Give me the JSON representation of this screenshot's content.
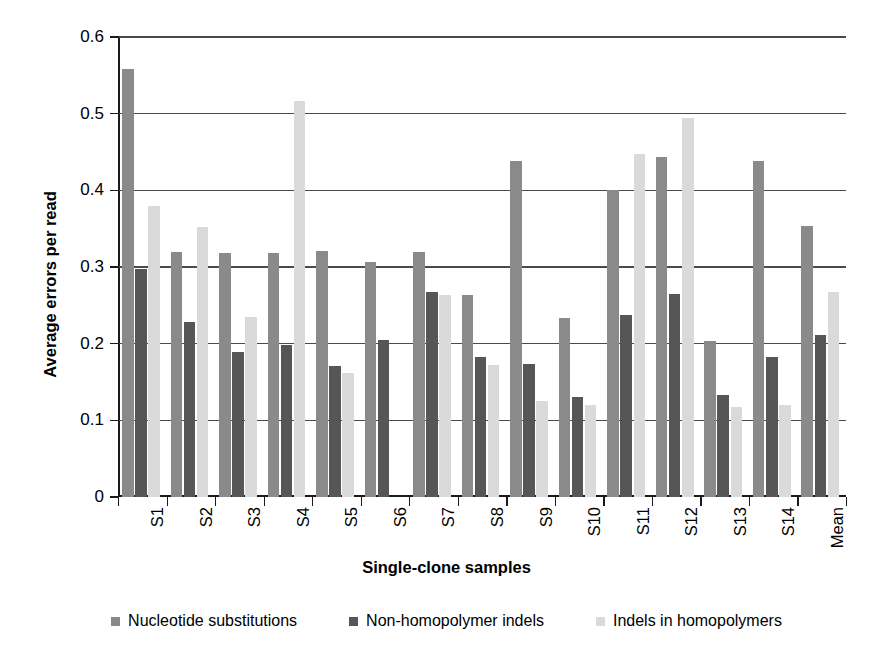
{
  "chart_data": {
    "type": "bar",
    "title": "",
    "xlabel": "Single-clone samples",
    "ylabel": "Average errors per read",
    "ylim": [
      0,
      0.6
    ],
    "yticks": [
      0,
      0.1,
      0.2,
      0.3,
      0.4,
      0.5,
      0.6
    ],
    "ytick_labels": [
      "0",
      "0.1",
      "0.2",
      "0.3",
      "0.4",
      "0.5",
      "0.6"
    ],
    "grid": true,
    "legend_position": "bottom",
    "categories": [
      "S1",
      "S2",
      "S3",
      "S4",
      "S5",
      "S6",
      "S7",
      "S8",
      "S9",
      "S10",
      "S11",
      "S12",
      "S13",
      "S14",
      "Mean"
    ],
    "series": [
      {
        "name": "Nucleotide substitutions",
        "color": "#8a8a8a",
        "values": [
          0.558,
          0.32,
          0.318,
          0.318,
          0.321,
          0.306,
          0.32,
          0.264,
          0.438,
          0.234,
          0.401,
          0.444,
          0.204,
          0.438,
          0.354
        ]
      },
      {
        "name": "Non-homopolymer indels",
        "color": "#565656",
        "values": [
          0.298,
          0.228,
          0.189,
          0.198,
          0.171,
          0.205,
          0.267,
          0.183,
          0.174,
          0.131,
          0.238,
          0.265,
          0.133,
          0.183,
          0.211
        ]
      },
      {
        "name": "Indels in homopolymers",
        "color": "#dadada",
        "values": [
          0.379,
          0.352,
          0.235,
          0.516,
          0.162,
          0.0,
          0.264,
          0.172,
          0.125,
          0.12,
          0.448,
          0.495,
          0.117,
          0.12,
          0.268
        ]
      }
    ]
  },
  "legend": {
    "items": [
      {
        "label": "Nucleotide substitutions",
        "color": "#8a8a8a"
      },
      {
        "label": "Non-homopolymer indels",
        "color": "#565656"
      },
      {
        "label": "Indels in homopolymers",
        "color": "#dadada"
      }
    ]
  }
}
